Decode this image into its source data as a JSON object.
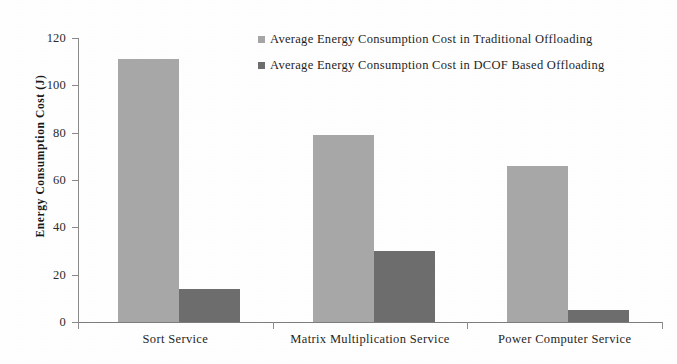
{
  "chart_data": {
    "type": "bar",
    "title": "",
    "subtitle": "",
    "xlabel": "",
    "ylabel": "Energy Consumption Cost (J)",
    "categories": [
      "Sort Service",
      "Matrix Multiplication Service",
      "Power Computer Service"
    ],
    "series": [
      {
        "name": "Average Energy Consumption Cost in Traditional Offloading",
        "color": "#a8a8a8",
        "values": [
          111,
          79,
          66
        ]
      },
      {
        "name": "Average Energy Consumption Cost in DCOF Based Offloading",
        "color": "#6e6e6e",
        "values": [
          14,
          30,
          5
        ]
      }
    ],
    "ylim": [
      0,
      120
    ],
    "ytick_values": [
      120,
      100,
      80,
      60,
      40,
      20,
      0
    ],
    "ytick_labels": [
      "120",
      "100",
      "80",
      "60",
      "40",
      "20",
      "0"
    ],
    "grid": false,
    "legend_position": "top-right",
    "annotations": []
  },
  "legend": {
    "entries": [
      {
        "label": "Average Energy Consumption Cost in Traditional Offloading",
        "marker": "square-marker-light"
      },
      {
        "label": "Average Energy Consumption Cost in DCOF Based Offloading",
        "marker": "square-marker-dark"
      }
    ]
  },
  "colors": {
    "series_traditional": "#a8a8a8",
    "series_dcof": "#6e6e6e",
    "axis": "#8a8a8a",
    "text": "#1a1a1a",
    "background": "#ffffff"
  }
}
